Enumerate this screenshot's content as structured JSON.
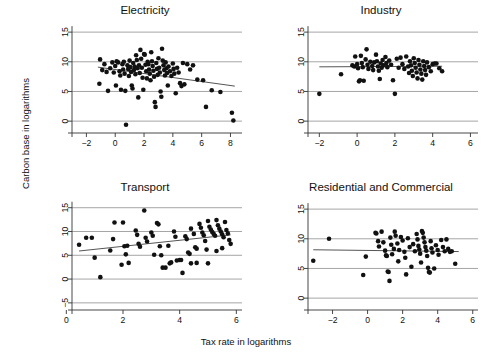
{
  "figure": {
    "xlabel": "Tax rate in logarithms",
    "ylabel": "Carbon base in logarithms",
    "background": "#ffffff",
    "point_color": "#111111",
    "grid_color": "#8e8e8e",
    "fit_color": "#555555"
  },
  "chart_data": [
    {
      "type": "scatter",
      "title": "Electricity",
      "xlabel": "Tax rate in logarithms",
      "ylabel": "Carbon base in logarithms",
      "xlim": [
        -3.0,
        8.8
      ],
      "ylim": [
        -2.0,
        16.2
      ],
      "xticks": [
        -2,
        0,
        2,
        4,
        6,
        8
      ],
      "yticks": [
        0,
        5,
        10,
        15
      ],
      "grid": true,
      "legend": "none",
      "fit_line": {
        "x": [
          -1.2,
          8.3
        ],
        "y": [
          9.1,
          5.9
        ]
      },
      "points": [
        [
          -1.05,
          10.4
        ],
        [
          -1.1,
          6.3
        ],
        [
          -0.9,
          8.6
        ],
        [
          -0.75,
          9.6
        ],
        [
          -0.6,
          8.3
        ],
        [
          -0.5,
          5.1
        ],
        [
          -0.35,
          8.9
        ],
        [
          -0.2,
          9.9
        ],
        [
          -0.1,
          8.2
        ],
        [
          0.0,
          9.3
        ],
        [
          0.05,
          6.0
        ],
        [
          0.1,
          10.1
        ],
        [
          0.2,
          9.9
        ],
        [
          0.3,
          8.4
        ],
        [
          0.35,
          7.7
        ],
        [
          0.4,
          5.3
        ],
        [
          0.5,
          9.6
        ],
        [
          0.55,
          8.7
        ],
        [
          0.6,
          10.0
        ],
        [
          0.65,
          8.0
        ],
        [
          0.7,
          5.1
        ],
        [
          0.75,
          -0.6
        ],
        [
          0.85,
          9.4
        ],
        [
          0.9,
          8.8
        ],
        [
          0.95,
          7.6
        ],
        [
          1.0,
          10.2
        ],
        [
          1.05,
          9.1
        ],
        [
          1.1,
          8.3
        ],
        [
          1.15,
          6.0
        ],
        [
          1.2,
          5.5
        ],
        [
          1.25,
          9.8
        ],
        [
          1.3,
          8.6
        ],
        [
          1.35,
          9.2
        ],
        [
          1.4,
          7.9
        ],
        [
          1.45,
          11.1
        ],
        [
          1.5,
          10.3
        ],
        [
          1.55,
          8.9
        ],
        [
          1.6,
          4.0
        ],
        [
          1.65,
          9.4
        ],
        [
          1.7,
          8.1
        ],
        [
          1.75,
          12.0
        ],
        [
          1.8,
          10.5
        ],
        [
          1.85,
          9.0
        ],
        [
          1.9,
          7.3
        ],
        [
          1.95,
          5.3
        ],
        [
          2.0,
          11.3
        ],
        [
          2.05,
          11.2
        ],
        [
          2.1,
          9.5
        ],
        [
          2.15,
          8.4
        ],
        [
          2.2,
          7.2
        ],
        [
          2.25,
          10.0
        ],
        [
          2.3,
          9.6
        ],
        [
          2.35,
          8.7
        ],
        [
          2.4,
          8.0
        ],
        [
          2.45,
          6.9
        ],
        [
          2.5,
          11.6
        ],
        [
          2.55,
          10.1
        ],
        [
          2.6,
          9.3
        ],
        [
          2.65,
          8.5
        ],
        [
          2.7,
          7.5
        ],
        [
          2.75,
          3.2
        ],
        [
          2.8,
          2.4
        ],
        [
          2.85,
          9.8
        ],
        [
          2.9,
          8.8
        ],
        [
          2.95,
          7.8
        ],
        [
          3.0,
          10.6
        ],
        [
          3.05,
          9.0
        ],
        [
          3.1,
          8.2
        ],
        [
          3.15,
          5.0
        ],
        [
          3.2,
          4.1
        ],
        [
          3.25,
          12.2
        ],
        [
          3.3,
          10.2
        ],
        [
          3.35,
          9.4
        ],
        [
          3.4,
          8.6
        ],
        [
          3.45,
          7.7
        ],
        [
          3.5,
          9.9
        ],
        [
          3.55,
          8.9
        ],
        [
          3.6,
          8.1
        ],
        [
          3.65,
          6.0
        ],
        [
          3.7,
          9.2
        ],
        [
          3.8,
          8.4
        ],
        [
          3.9,
          7.6
        ],
        [
          4.0,
          9.7
        ],
        [
          4.05,
          8.8
        ],
        [
          4.1,
          8.0
        ],
        [
          4.2,
          4.7
        ],
        [
          4.3,
          9.0
        ],
        [
          4.4,
          8.2
        ],
        [
          4.5,
          6.4
        ],
        [
          4.6,
          5.9
        ],
        [
          4.7,
          9.8
        ],
        [
          4.8,
          6.2
        ],
        [
          5.0,
          9.6
        ],
        [
          5.2,
          8.7
        ],
        [
          5.4,
          9.4
        ],
        [
          5.7,
          7.0
        ],
        [
          6.1,
          6.9
        ],
        [
          6.3,
          2.4
        ],
        [
          6.7,
          5.2
        ],
        [
          7.3,
          4.9
        ],
        [
          8.1,
          1.4
        ],
        [
          8.2,
          0.1
        ]
      ]
    },
    {
      "type": "scatter",
      "title": "Industry",
      "xlabel": "Tax rate in logarithms",
      "ylabel": "Carbon base in logarithms",
      "xlim": [
        -2.6,
        6.4
      ],
      "ylim": [
        -2.0,
        16.2
      ],
      "xticks": [
        -2,
        0,
        2,
        4,
        6
      ],
      "yticks": [
        0,
        5,
        10,
        15
      ],
      "grid": true,
      "legend": "none",
      "fit_line": {
        "x": [
          -2.0,
          4.5
        ],
        "y": [
          9.15,
          9.25
        ]
      },
      "points": [
        [
          -2.0,
          4.6
        ],
        [
          -0.85,
          7.9
        ],
        [
          -0.25,
          9.4
        ],
        [
          -0.15,
          9.2
        ],
        [
          -0.1,
          10.9
        ],
        [
          0.0,
          9.6
        ],
        [
          0.05,
          8.9
        ],
        [
          0.1,
          6.7
        ],
        [
          0.15,
          6.9
        ],
        [
          0.2,
          11.0
        ],
        [
          0.25,
          9.8
        ],
        [
          0.3,
          9.1
        ],
        [
          0.35,
          6.8
        ],
        [
          0.45,
          10.4
        ],
        [
          0.5,
          12.1
        ],
        [
          0.55,
          9.5
        ],
        [
          0.6,
          8.8
        ],
        [
          0.7,
          10.0
        ],
        [
          0.8,
          9.3
        ],
        [
          0.85,
          8.6
        ],
        [
          0.9,
          9.9
        ],
        [
          1.0,
          11.2
        ],
        [
          1.05,
          10.1
        ],
        [
          1.1,
          9.2
        ],
        [
          1.15,
          8.5
        ],
        [
          1.2,
          7.1
        ],
        [
          1.25,
          9.7
        ],
        [
          1.3,
          9.0
        ],
        [
          1.35,
          10.3
        ],
        [
          1.4,
          9.4
        ],
        [
          1.5,
          10.8
        ],
        [
          1.55,
          9.8
        ],
        [
          1.6,
          9.1
        ],
        [
          1.7,
          10.2
        ],
        [
          1.8,
          9.5
        ],
        [
          1.9,
          6.9
        ],
        [
          2.0,
          4.6
        ],
        [
          2.1,
          10.5
        ],
        [
          2.2,
          9.0
        ],
        [
          2.3,
          10.7
        ],
        [
          2.4,
          9.6
        ],
        [
          2.5,
          8.8
        ],
        [
          2.6,
          10.9
        ],
        [
          2.7,
          9.2
        ],
        [
          2.75,
          8.1
        ],
        [
          2.8,
          10.1
        ],
        [
          2.85,
          9.4
        ],
        [
          2.9,
          8.5
        ],
        [
          2.95,
          7.6
        ],
        [
          3.0,
          10.6
        ],
        [
          3.05,
          9.8
        ],
        [
          3.1,
          9.0
        ],
        [
          3.15,
          8.2
        ],
        [
          3.2,
          7.2
        ],
        [
          3.25,
          10.3
        ],
        [
          3.3,
          9.5
        ],
        [
          3.35,
          8.7
        ],
        [
          3.4,
          8.0
        ],
        [
          3.45,
          7.0
        ],
        [
          3.5,
          10.1
        ],
        [
          3.55,
          9.3
        ],
        [
          3.6,
          8.6
        ],
        [
          3.65,
          7.8
        ],
        [
          3.7,
          9.9
        ],
        [
          3.8,
          9.1
        ],
        [
          3.9,
          8.4
        ],
        [
          4.0,
          9.6
        ],
        [
          4.1,
          9.7
        ],
        [
          4.2,
          9.7
        ],
        [
          4.35,
          8.9
        ],
        [
          4.5,
          8.4
        ]
      ]
    },
    {
      "type": "scatter",
      "title": "Transport",
      "xlabel": "Tax rate in logarithms",
      "ylabel": "Carbon base in logarithms",
      "xlim": [
        0.2,
        6.2
      ],
      "ylim": [
        -6.5,
        16.2
      ],
      "xticks": [
        0,
        2,
        4,
        6
      ],
      "yticks": [
        -5,
        0,
        5,
        10,
        15
      ],
      "grid": true,
      "legend": "none",
      "fit_line": {
        "x": [
          0.45,
          5.8
        ],
        "y": [
          5.9,
          9.3
        ]
      },
      "points": [
        [
          0.45,
          7.2
        ],
        [
          0.7,
          8.7
        ],
        [
          0.9,
          8.7
        ],
        [
          1.0,
          4.5
        ],
        [
          1.2,
          0.4
        ],
        [
          1.55,
          6.0
        ],
        [
          1.65,
          8.4
        ],
        [
          1.7,
          11.9
        ],
        [
          1.95,
          3.0
        ],
        [
          2.0,
          11.9
        ],
        [
          2.05,
          6.9
        ],
        [
          2.1,
          5.2
        ],
        [
          2.15,
          7.0
        ],
        [
          2.2,
          3.4
        ],
        [
          2.45,
          10.2
        ],
        [
          2.5,
          9.3
        ],
        [
          2.55,
          7.4
        ],
        [
          2.6,
          6.8
        ],
        [
          2.75,
          14.4
        ],
        [
          2.8,
          8.7
        ],
        [
          2.85,
          7.9
        ],
        [
          3.0,
          9.8
        ],
        [
          3.05,
          9.1
        ],
        [
          3.1,
          5.1
        ],
        [
          3.2,
          11.8
        ],
        [
          3.25,
          11.5
        ],
        [
          3.3,
          6.9
        ],
        [
          3.35,
          5.0
        ],
        [
          3.4,
          2.4
        ],
        [
          3.5,
          2.4
        ],
        [
          3.6,
          7.0
        ],
        [
          3.65,
          3.3
        ],
        [
          3.7,
          3.5
        ],
        [
          3.8,
          10.0
        ],
        [
          3.85,
          8.9
        ],
        [
          3.9,
          3.9
        ],
        [
          4.0,
          4.0
        ],
        [
          4.05,
          4.0
        ],
        [
          4.1,
          1.3
        ],
        [
          4.2,
          9.0
        ],
        [
          4.25,
          8.4
        ],
        [
          4.3,
          5.6
        ],
        [
          4.35,
          5.3
        ],
        [
          4.4,
          10.6
        ],
        [
          4.5,
          9.5
        ],
        [
          4.55,
          6.7
        ],
        [
          4.6,
          3.4
        ],
        [
          4.7,
          11.6
        ],
        [
          4.75,
          10.8
        ],
        [
          4.8,
          9.8
        ],
        [
          4.85,
          9.2
        ],
        [
          4.9,
          8.0
        ],
        [
          4.95,
          6.2
        ],
        [
          5.0,
          12.2
        ],
        [
          5.05,
          11.0
        ],
        [
          5.1,
          10.4
        ],
        [
          5.15,
          9.9
        ],
        [
          5.2,
          9.5
        ],
        [
          5.25,
          9.1
        ],
        [
          5.3,
          12.4
        ],
        [
          5.35,
          11.3
        ],
        [
          5.4,
          10.6
        ],
        [
          5.45,
          10.0
        ],
        [
          5.5,
          9.4
        ],
        [
          5.55,
          8.8
        ],
        [
          5.6,
          12.0
        ],
        [
          5.65,
          10.3
        ],
        [
          5.7,
          9.6
        ],
        [
          5.75,
          8.2
        ],
        [
          5.8,
          7.4
        ],
        [
          4.6,
          6.4
        ],
        [
          5.0,
          3.3
        ],
        [
          4.4,
          3.3
        ],
        [
          5.3,
          5.9
        ],
        [
          5.5,
          6.5
        ]
      ]
    },
    {
      "type": "scatter",
      "title": "Residential and Commercial",
      "xlabel": "Tax rate in logarithms",
      "ylabel": "Carbon base in logarithms",
      "xlim": [
        -3.4,
        6.3
      ],
      "ylim": [
        -2.0,
        16.2
      ],
      "xticks": [
        -2,
        0,
        2,
        4,
        6
      ],
      "yticks": [
        0,
        5,
        10,
        15
      ],
      "grid": true,
      "legend": "none",
      "fit_line": {
        "x": [
          -3.1,
          5.2
        ],
        "y": [
          8.15,
          7.85
        ]
      },
      "points": [
        [
          -3.1,
          6.3
        ],
        [
          -2.2,
          10.0
        ],
        [
          -0.1,
          7.0
        ],
        [
          -0.25,
          3.9
        ],
        [
          0.45,
          11.0
        ],
        [
          0.5,
          10.9
        ],
        [
          0.6,
          9.6
        ],
        [
          0.65,
          8.7
        ],
        [
          0.8,
          11.2
        ],
        [
          0.9,
          9.4
        ],
        [
          1.0,
          8.0
        ],
        [
          1.05,
          7.2
        ],
        [
          1.1,
          7.1
        ],
        [
          1.15,
          4.5
        ],
        [
          1.2,
          4.4
        ],
        [
          1.25,
          2.9
        ],
        [
          1.3,
          10.2
        ],
        [
          1.35,
          9.0
        ],
        [
          1.4,
          7.4
        ],
        [
          1.5,
          8.3
        ],
        [
          1.55,
          11.2
        ],
        [
          1.6,
          10.5
        ],
        [
          1.7,
          9.2
        ],
        [
          1.75,
          6.2
        ],
        [
          1.8,
          8.1
        ],
        [
          1.9,
          10.3
        ],
        [
          2.0,
          9.7
        ],
        [
          2.1,
          7.8
        ],
        [
          2.15,
          6.8
        ],
        [
          2.2,
          4.0
        ],
        [
          2.3,
          10.1
        ],
        [
          2.4,
          8.6
        ],
        [
          2.5,
          5.3
        ],
        [
          2.6,
          9.1
        ],
        [
          2.7,
          7.9
        ],
        [
          2.8,
          10.8
        ],
        [
          2.85,
          9.9
        ],
        [
          2.9,
          8.8
        ],
        [
          2.95,
          8.2
        ],
        [
          3.0,
          7.5
        ],
        [
          3.05,
          6.0
        ],
        [
          3.1,
          11.3
        ],
        [
          3.15,
          11.0
        ],
        [
          3.2,
          10.2
        ],
        [
          3.25,
          9.4
        ],
        [
          3.3,
          8.6
        ],
        [
          3.35,
          8.0
        ],
        [
          3.4,
          7.1
        ],
        [
          3.45,
          5.1
        ],
        [
          3.5,
          4.4
        ],
        [
          3.55,
          4.3
        ],
        [
          3.6,
          9.6
        ],
        [
          3.65,
          8.4
        ],
        [
          3.7,
          7.7
        ],
        [
          3.8,
          5.0
        ],
        [
          3.9,
          8.9
        ],
        [
          4.0,
          8.1
        ],
        [
          4.05,
          7.3
        ],
        [
          4.2,
          9.8
        ],
        [
          4.3,
          8.6
        ],
        [
          4.4,
          7.9
        ],
        [
          4.5,
          9.9
        ],
        [
          4.6,
          8.3
        ],
        [
          4.7,
          7.8
        ],
        [
          4.8,
          7.9
        ],
        [
          5.0,
          5.8
        ]
      ]
    }
  ]
}
